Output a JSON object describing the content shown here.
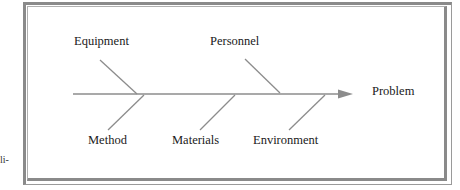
{
  "diagram": {
    "type": "fishbone",
    "effect": "Problem",
    "causes_top": [
      "Equipment",
      "Personnel"
    ],
    "causes_bottom": [
      "Method",
      "Materials",
      "Environment"
    ]
  },
  "labels": {
    "equipment": "Equipment",
    "personnel": "Personnel",
    "method": "Method",
    "materials": "Materials",
    "environment": "Environment",
    "problem": "Problem"
  },
  "margin_fragment": "li-",
  "colors": {
    "line": "#8c8c8c",
    "frame": "#8a8a8a",
    "text": "#1a1a1a"
  }
}
